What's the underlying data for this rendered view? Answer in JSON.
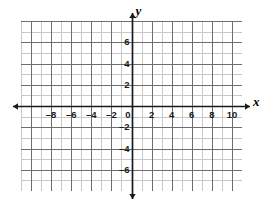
{
  "chart_data": {
    "type": "scatter",
    "title": "",
    "subtitle": "",
    "xlabel": "x",
    "ylabel": "y",
    "xlim": [
      -11,
      11
    ],
    "ylim": [
      -8,
      8
    ],
    "grid": true,
    "minor_grid": true,
    "major_tick_step": 2,
    "minor_tick_step": 1,
    "legend": null,
    "series": [],
    "values": [],
    "x": [],
    "categories": [],
    "annotations": [],
    "x_tick_labels": [
      "–8",
      "–6",
      "–4",
      "–2",
      "2",
      "4",
      "6",
      "8",
      "10"
    ],
    "x_tick_values": [
      -8,
      -6,
      -4,
      -2,
      2,
      4,
      6,
      8,
      10
    ],
    "y_tick_labels": [
      "6",
      "4",
      "2",
      "–2",
      "–4",
      "–6"
    ],
    "y_tick_values": [
      6,
      4,
      2,
      -2,
      -4,
      -6
    ],
    "origin_label": "0",
    "colors": {
      "minor_grid": "#c8c8c8",
      "major_grid": "#6e6e6e",
      "axis": "#1a1a1a",
      "label": "#1a1a1a",
      "background": "#ffffff"
    }
  },
  "axis_names": {
    "x": "x",
    "y": "y"
  },
  "origin": {
    "label": "0"
  }
}
